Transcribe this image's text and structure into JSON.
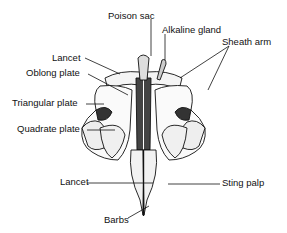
{
  "diagram": {
    "labels": {
      "poison_sac": "Poison sac",
      "alkaline_gland": "Alkaline gland",
      "sheath_arm": "Sheath arm",
      "lancet_top": "Lancet",
      "oblong_plate": "Oblong plate",
      "triangular_plate": "Triangular plate",
      "quadrate_plate": "Quadrate plate",
      "lancet_bottom": "Lancet",
      "sting_palp": "Sting palp",
      "barbs": "Barbs"
    },
    "colors": {
      "ink": "#111111",
      "background": "#ffffff",
      "shade": "#555555"
    }
  }
}
